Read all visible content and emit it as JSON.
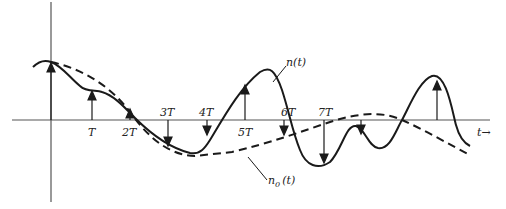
{
  "diagram": {
    "type": "signal-sampling-plot",
    "axes": {
      "x_label": "t→",
      "origin_px": [
        51,
        120
      ]
    },
    "tick_labels": [
      {
        "label": "T",
        "x": 92
      },
      {
        "label": "2T",
        "x": 130
      },
      {
        "label": "3T",
        "x": 168
      },
      {
        "label": "4T",
        "x": 207
      },
      {
        "label": "5T",
        "x": 245
      },
      {
        "label": "6T",
        "x": 287
      },
      {
        "label": "7T",
        "x": 324
      }
    ],
    "curves": [
      {
        "name": "n(t)",
        "style": "solid",
        "label": "n(t)"
      },
      {
        "name": "n0(t)",
        "style": "dashed",
        "label_main": "n",
        "label_sub": "0",
        "label_arg": "(t)"
      }
    ],
    "colors": {
      "stroke": "#1a1a1a",
      "axis": "#555555",
      "background": "#ffffff"
    }
  }
}
